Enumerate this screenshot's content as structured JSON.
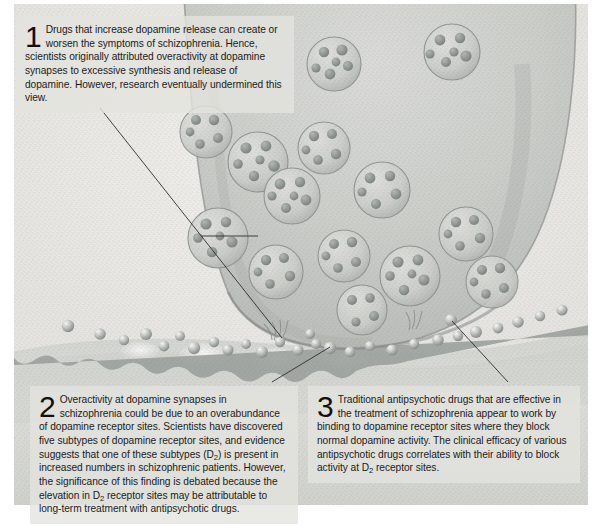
{
  "figure": {
    "medium": "colored-pencil scientific illustration"
  },
  "notes": [
    {
      "number": "1",
      "text": "Drugs that increase dopamine release can create or worsen the symptoms of schizophrenia. Hence, scientists originally attributed overactivity at dopamine synapses to excessive synthesis and release of dopamine. However, research eventually undermined this view.",
      "leader_from": [
        100,
        108
      ],
      "leader_to": [
        282,
        338
      ]
    },
    {
      "number": "2",
      "text_part1": "Overactivity at dopamine synapses in schizophrenia could be due to an overabundance of dopamine receptor sites. Scientists have discovered five subtypes of dopamine receptor sites, and evidence suggests that one of these subtypes (D",
      "sub1": "2",
      "text_part2": ") is present in increased numbers in schizophrenic patients. However, the significance of this finding is debated because the elevation in D",
      "sub2": "2",
      "text_part3": " receptor sites may be attributable to long-term treatment with antipsychotic drugs.",
      "leader_from": [
        274,
        380
      ],
      "leader_to": [
        316,
        344
      ]
    },
    {
      "number": "3",
      "text_part1": "Traditional antipsychotic drugs that are effective in the treatment of schizophrenia appear to work by binding to dopamine receptor sites where they block normal dopamine activity. The clinical efficacy of various antipsychotic drugs correlates with their ability to block activity at D",
      "sub1": "2",
      "text_part2": " receptor sites.",
      "leader_from": [
        508,
        380
      ],
      "leader_to": [
        451,
        320
      ]
    }
  ],
  "callout_line": {
    "color": "#2b2b2b",
    "width": 0.9
  },
  "palette": {
    "paper": "#eceae6",
    "panel_fill": "#e4e3df",
    "text": "#1b1b1b",
    "terminal_fill": "#cfd0cc",
    "terminal_edge": "#9a9c98",
    "vesicle_fill": "#d6d7d3",
    "vesicle_edge": "#8e9490",
    "granule": "#8d938f",
    "cleft": "#f3f2ef",
    "postsynaptic": "#d9dad6",
    "membrane": "#9ba09c",
    "molecule": "#b9bcb8"
  },
  "counts": {
    "vesicles": 14,
    "cleft_molecules": 26,
    "receptor_pockets": 15
  }
}
